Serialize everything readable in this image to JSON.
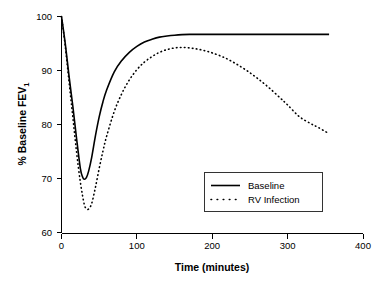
{
  "chart_data": {
    "type": "line",
    "title": "",
    "xlabel": "Time (minutes)",
    "ylabel": "% Baseline FEV",
    "ylabel_subscript": "1",
    "xlim": [
      0,
      400
    ],
    "ylim": [
      60,
      100
    ],
    "xticks": [
      0,
      100,
      200,
      300,
      400
    ],
    "yticks": [
      60,
      70,
      80,
      90,
      100
    ],
    "grid": false,
    "legend_position": "center-right",
    "axis_color": "#000000",
    "series": [
      {
        "name": "Baseline",
        "style": "solid",
        "color": "#000000",
        "x": [
          0,
          5,
          10,
          15,
          20,
          25,
          28,
          30,
          33,
          36,
          40,
          45,
          50,
          55,
          60,
          70,
          80,
          90,
          100,
          110,
          120,
          130,
          140,
          150,
          160,
          170,
          180,
          200,
          220,
          240,
          260,
          280,
          300,
          320,
          340,
          355
        ],
        "y": [
          100.0,
          95.0,
          89.0,
          83.5,
          77.5,
          72.0,
          70.4,
          70.0,
          70.3,
          71.5,
          74.0,
          78.0,
          81.5,
          84.3,
          86.5,
          89.8,
          91.9,
          93.4,
          94.5,
          95.3,
          95.8,
          96.2,
          96.4,
          96.55,
          96.65,
          96.7,
          96.7,
          96.7,
          96.7,
          96.7,
          96.7,
          96.7,
          96.7,
          96.7,
          96.7,
          96.7
        ]
      },
      {
        "name": "RV Infection",
        "style": "dotted",
        "color": "#000000",
        "x": [
          0,
          5,
          10,
          15,
          20,
          25,
          30,
          33,
          36,
          40,
          45,
          50,
          55,
          60,
          70,
          80,
          90,
          100,
          110,
          120,
          130,
          140,
          150,
          160,
          170,
          180,
          190,
          200,
          215,
          230,
          245,
          260,
          275,
          290,
          300,
          315,
          330,
          340,
          350,
          355
        ],
        "y": [
          100.0,
          94.5,
          88.0,
          81.5,
          75.0,
          69.5,
          65.5,
          64.6,
          64.5,
          65.5,
          68.5,
          72.0,
          75.2,
          78.0,
          82.5,
          85.8,
          88.3,
          90.2,
          91.6,
          92.6,
          93.4,
          93.9,
          94.2,
          94.3,
          94.2,
          94.0,
          93.7,
          93.3,
          92.5,
          91.4,
          90.1,
          88.6,
          86.9,
          85.0,
          83.7,
          81.6,
          80.3,
          79.6,
          78.8,
          78.5
        ]
      }
    ],
    "legend": [
      {
        "label": "Baseline",
        "style": "solid"
      },
      {
        "label": "RV Infection",
        "style": "dotted"
      }
    ]
  }
}
